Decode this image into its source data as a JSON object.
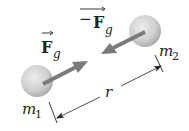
{
  "diagram": {
    "masses": [
      {
        "id": "m1",
        "label_main": "m",
        "label_sub": "1"
      },
      {
        "id": "m2",
        "label_main": "m",
        "label_sub": "2"
      }
    ],
    "forces": [
      {
        "id": "Fg",
        "prefix": "",
        "symbol": "F",
        "sub": "g",
        "on": "m1",
        "direction": "toward m2"
      },
      {
        "id": "neg-Fg",
        "prefix": "−",
        "symbol": "F",
        "sub": "g",
        "on": "m2",
        "direction": "toward m1"
      }
    ],
    "distance": {
      "label": "r"
    },
    "colors": {
      "sphere_light": "#e6e6e6",
      "sphere_dark": "#a8a8a8",
      "arrow": "#7a7a7a",
      "line": "#222222",
      "text": "#222222"
    }
  }
}
